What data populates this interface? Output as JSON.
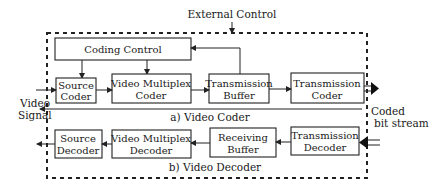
{
  "diagram": {
    "external_control_label": "External Control",
    "coding_control": "Coding Control",
    "coder": {
      "caption": "a)  Video Coder",
      "blocks": [
        {
          "line1": "Source",
          "line2": "Coder"
        },
        {
          "line1": "Video Multiplex",
          "line2": "Coder"
        },
        {
          "line1": "Transmission",
          "line2": "Buffer"
        },
        {
          "line1": "Transmission",
          "line2": "Coder"
        }
      ]
    },
    "decoder": {
      "caption": "b)  Video Decoder",
      "blocks": [
        {
          "line1": "Source",
          "line2": "Decoder"
        },
        {
          "line1": "Video Multiplex",
          "line2": "Decoder"
        },
        {
          "line1": "Receiving",
          "line2": "Buffer"
        },
        {
          "line1": "Transmission",
          "line2": "Decoder"
        }
      ]
    },
    "input_label": {
      "line1": "Video",
      "line2": "Signal"
    },
    "output_label": {
      "line1": "Coded",
      "line2": "bit stream"
    }
  }
}
